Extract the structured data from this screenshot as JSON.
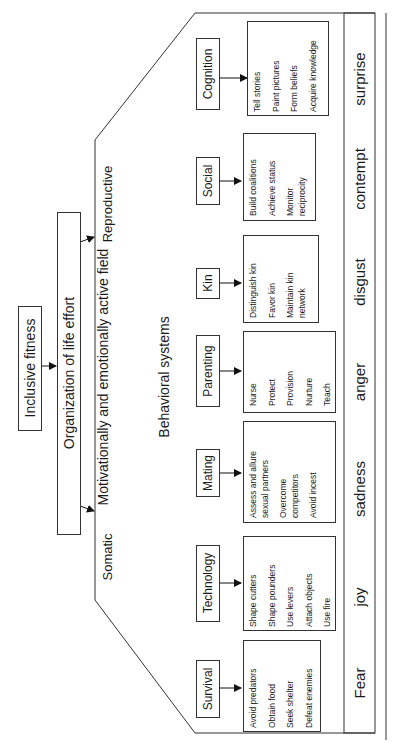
{
  "top": {
    "inclusive_fitness": "Inclusive fitness",
    "organization": "Organization of life effort"
  },
  "branches": {
    "somatic": "Somatic",
    "reproductive": "Reproductive"
  },
  "field": {
    "title": "Motivationally and emotionally active field",
    "subtitle": "Behavioral systems"
  },
  "systems": [
    {
      "name": "Survival",
      "items": [
        "Avoid predators",
        "Obtain food",
        "Seek shelter",
        "Defeat enemies"
      ]
    },
    {
      "name": "Technology",
      "items": [
        "Shape cutters",
        "Shape pounders",
        "Use levers",
        "Attach objects",
        "Use fire"
      ]
    },
    {
      "name": "Mating",
      "items": [
        "Assess and allure",
        "sexual partners",
        "Overcome",
        "competitors",
        "Avoid incest"
      ]
    },
    {
      "name": "Parenting",
      "items": [
        "Nurse",
        "Protect",
        "Provision",
        "Nurture",
        "Teach"
      ]
    },
    {
      "name": "Kin",
      "items": [
        "Distinguish kin",
        "Favor kin",
        "Maintain kin",
        "network"
      ]
    },
    {
      "name": "Social",
      "items": [
        "Build coalitions",
        "Achieve status",
        "Monitor",
        "reciprocity"
      ]
    },
    {
      "name": "Cognition",
      "items": [
        "Tell stories",
        "Paint pictures",
        "Form beliefs",
        "Acquire knowledge"
      ]
    }
  ],
  "emotions": [
    "Fear",
    "joy",
    "sadness",
    "anger",
    "disgust",
    "contempt",
    "surprise"
  ],
  "colors": {
    "line": "#333333",
    "text": "#1a1a1a",
    "background": "#ffffff"
  }
}
